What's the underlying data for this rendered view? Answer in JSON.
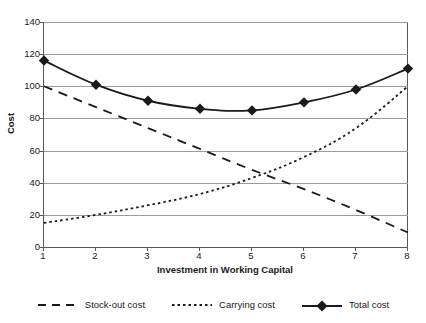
{
  "chart_data": {
    "type": "line",
    "title": "",
    "xlabel": "Investment in Working Capital",
    "ylabel": "Cost",
    "xlim": [
      1,
      8
    ],
    "ylim": [
      0,
      140
    ],
    "ytick_step": 20,
    "grid": true,
    "legend_position": "bottom",
    "x": [
      1,
      2,
      3,
      4,
      5,
      6,
      7,
      8
    ],
    "xtick_labels": [
      "1",
      "2",
      "3",
      "4",
      "5",
      "6",
      "7",
      "8"
    ],
    "ytick_labels": [
      "0",
      "20",
      "40",
      "60",
      "80",
      "100",
      "120",
      "140"
    ],
    "ytick_values": [
      0,
      20,
      40,
      60,
      80,
      100,
      120,
      140
    ],
    "series": [
      {
        "name": "Stock-out cost",
        "style": "dashed",
        "marker": "none",
        "color": "#1a1a1a",
        "values": [
          100,
          87,
          74,
          61,
          48,
          36,
          23,
          9
        ]
      },
      {
        "name": "Carrying cost",
        "style": "dotted",
        "marker": "none",
        "color": "#1a1a1a",
        "values": [
          15,
          20,
          26,
          33,
          43,
          56,
          74,
          100
        ]
      },
      {
        "name": "Total cost",
        "style": "solid",
        "marker": "diamond",
        "color": "#1a1a1a",
        "values": [
          116,
          101,
          91,
          86,
          85,
          90,
          98,
          111
        ]
      }
    ]
  },
  "legend": {
    "items": [
      {
        "label": "Stock-out cost",
        "swatch": "dashed-line-swatch"
      },
      {
        "label": "Carrying cost",
        "swatch": "dotted-line-swatch"
      },
      {
        "label": "Total cost",
        "swatch": "solid-line-diamond-swatch"
      }
    ]
  },
  "axes": {
    "y_title": "Cost",
    "x_title": "Investment in Working Capital"
  },
  "colors": {
    "axis": "#58595b",
    "gridline": "#9a9b9e",
    "series": "#1a1a1a",
    "background": "#ffffff"
  }
}
